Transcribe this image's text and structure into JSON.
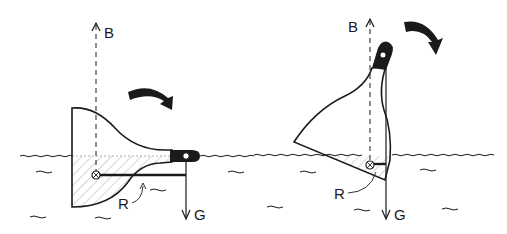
{
  "diagram": {
    "colors": {
      "ink": "#1a1a1a",
      "background": "#ffffff",
      "hatch": "#888888"
    },
    "panels": [
      {
        "id": "left",
        "state": "horizontal",
        "labels": {
          "buoyancy": "B",
          "gravity": "G",
          "righting_arm": "R"
        },
        "rotation_arrow": "clockwise"
      },
      {
        "id": "right",
        "state": "tilted",
        "labels": {
          "buoyancy": "B",
          "gravity": "G",
          "righting_arm": "R"
        },
        "rotation_arrow": "clockwise"
      }
    ]
  }
}
